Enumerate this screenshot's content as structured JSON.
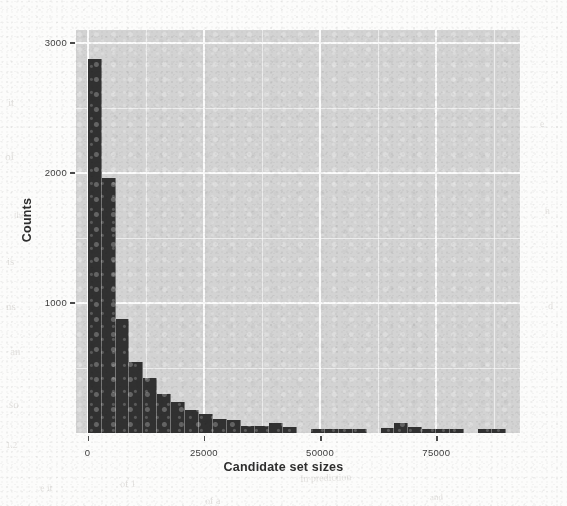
{
  "page": {
    "background_color": "#fcfcfb",
    "bleed_through_fragments": [
      {
        "text": "it",
        "x": 8,
        "y": 96
      },
      {
        "text": "of",
        "x": 5,
        "y": 150
      },
      {
        "text": "the",
        "x": 14,
        "y": 210
      },
      {
        "text": "is",
        "x": 7,
        "y": 255
      },
      {
        "text": "ns",
        "x": 6,
        "y": 300
      },
      {
        "text": "an",
        "x": 10,
        "y": 345
      },
      {
        "text": "so",
        "x": 9,
        "y": 398
      },
      {
        "text": "1.2",
        "x": 6,
        "y": 440
      },
      {
        "text": "e",
        "x": 540,
        "y": 118
      },
      {
        "text": "n",
        "x": 545,
        "y": 205
      },
      {
        "text": "d",
        "x": 548,
        "y": 300
      },
      {
        "text": "of 1",
        "x": 120,
        "y": 478
      },
      {
        "text": "In prediction",
        "x": 300,
        "y": 472
      },
      {
        "text": "e it",
        "x": 40,
        "y": 482
      },
      {
        "text": "of a",
        "x": 205,
        "y": 495
      },
      {
        "text": "and",
        "x": 430,
        "y": 492
      }
    ]
  },
  "chart_data": {
    "type": "bar",
    "subtype": "histogram",
    "title": "",
    "xlabel": "Candidate set sizes",
    "ylabel": "Counts",
    "xlim": [
      -2500,
      93000
    ],
    "ylim": [
      0,
      3100
    ],
    "xticks": [
      0,
      25000,
      50000,
      75000
    ],
    "xtick_labels": [
      "0",
      "25000",
      "50000",
      "75000"
    ],
    "yticks": [
      1000,
      2000,
      3000
    ],
    "ytick_labels": [
      "1000",
      "2000",
      "3000"
    ],
    "grid": true,
    "grid_color": "#ffffff",
    "panel_color": "#d6d6d6",
    "bar_color": "#2f2f2f",
    "bin_width": 3000,
    "legend": "none",
    "bins": [
      {
        "x0": 0,
        "x1": 3000,
        "count": 2880
      },
      {
        "x0": 3000,
        "x1": 6000,
        "count": 1960
      },
      {
        "x0": 6000,
        "x1": 9000,
        "count": 880
      },
      {
        "x0": 9000,
        "x1": 12000,
        "count": 550
      },
      {
        "x0": 12000,
        "x1": 15000,
        "count": 420
      },
      {
        "x0": 15000,
        "x1": 18000,
        "count": 300
      },
      {
        "x0": 18000,
        "x1": 21000,
        "count": 240
      },
      {
        "x0": 21000,
        "x1": 24000,
        "count": 175
      },
      {
        "x0": 24000,
        "x1": 27000,
        "count": 150
      },
      {
        "x0": 27000,
        "x1": 30000,
        "count": 105
      },
      {
        "x0": 30000,
        "x1": 33000,
        "count": 100
      },
      {
        "x0": 33000,
        "x1": 36000,
        "count": 55
      },
      {
        "x0": 36000,
        "x1": 39000,
        "count": 55
      },
      {
        "x0": 39000,
        "x1": 42000,
        "count": 80
      },
      {
        "x0": 42000,
        "x1": 45000,
        "count": 50
      },
      {
        "x0": 45000,
        "x1": 48000,
        "count": 0
      },
      {
        "x0": 48000,
        "x1": 51000,
        "count": 30
      },
      {
        "x0": 51000,
        "x1": 54000,
        "count": 30
      },
      {
        "x0": 54000,
        "x1": 57000,
        "count": 32
      },
      {
        "x0": 57000,
        "x1": 60000,
        "count": 30
      },
      {
        "x0": 60000,
        "x1": 63000,
        "count": 0
      },
      {
        "x0": 63000,
        "x1": 66000,
        "count": 42
      },
      {
        "x0": 66000,
        "x1": 69000,
        "count": 75
      },
      {
        "x0": 69000,
        "x1": 72000,
        "count": 45
      },
      {
        "x0": 72000,
        "x1": 75000,
        "count": 30
      },
      {
        "x0": 75000,
        "x1": 78000,
        "count": 30
      },
      {
        "x0": 78000,
        "x1": 81000,
        "count": 30
      },
      {
        "x0": 81000,
        "x1": 84000,
        "count": 0
      },
      {
        "x0": 84000,
        "x1": 87000,
        "count": 28
      },
      {
        "x0": 87000,
        "x1": 90000,
        "count": 28
      }
    ]
  }
}
